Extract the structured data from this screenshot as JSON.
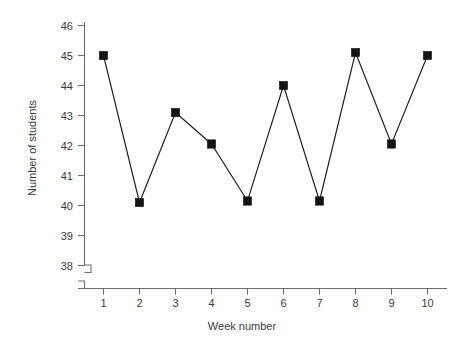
{
  "chart_data": {
    "type": "line",
    "title": "",
    "xlabel": "Week number",
    "ylabel": "Number of students",
    "x": [
      1,
      2,
      3,
      4,
      5,
      6,
      7,
      8,
      9,
      10
    ],
    "values": [
      45.0,
      40.1,
      43.1,
      42.05,
      40.15,
      44.0,
      40.15,
      45.1,
      42.05,
      45.0
    ],
    "series": [
      {
        "name": "Number of students",
        "values": [
          45.0,
          40.1,
          43.1,
          42.05,
          40.15,
          44.0,
          40.15,
          45.1,
          42.05,
          45.0
        ]
      }
    ],
    "xtick_labels": [
      "1",
      "2",
      "3",
      "4",
      "5",
      "6",
      "7",
      "8",
      "9",
      "10"
    ],
    "ytick_labels": [
      "38",
      "39",
      "40",
      "41",
      "42",
      "43",
      "44",
      "45",
      "46"
    ],
    "yticks": [
      38,
      39,
      40,
      41,
      42,
      43,
      44,
      45,
      46
    ],
    "xlim": [
      0.5,
      10.8
    ],
    "ylim": [
      38,
      46
    ],
    "grid": false,
    "legend": false,
    "legend_position": "none",
    "marker": "filled-square",
    "axis_break_x": true,
    "axis_break_y": true,
    "colors": {
      "line": "#1c1c1c",
      "marker": "#141414",
      "axis": "#6e6e6e",
      "text": "#3a3a3a",
      "background": "#ffffff"
    }
  }
}
